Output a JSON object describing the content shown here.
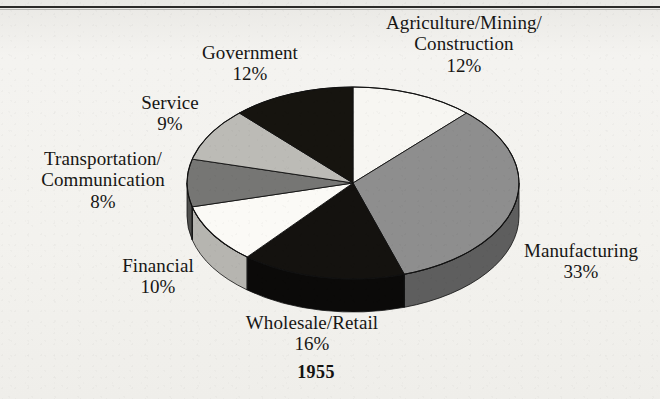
{
  "figure": {
    "year_label": "1955",
    "background_color": "#f2f1ee",
    "rule_color": "#2c2a28"
  },
  "chart_data": {
    "type": "pie",
    "title": "1955",
    "xlabel": "",
    "ylabel": "",
    "units": "percent",
    "total": 100,
    "start_angle_deg": 0,
    "direction": "clockwise",
    "three_d": true,
    "legend_position": "outside-labels",
    "grid": false,
    "categories": [
      "Agriculture/Mining/Construction",
      "Manufacturing",
      "Wholesale/Retail",
      "Financial",
      "Transportation/Communication",
      "Service",
      "Government"
    ],
    "values": [
      12,
      33,
      16,
      10,
      8,
      9,
      12
    ],
    "slices": [
      {
        "name": "Agriculture/Mining/Construction",
        "label_line1": "Agriculture/Mining/",
        "label_line2": "Construction",
        "value": 12,
        "percent_label": "12%",
        "color": "#f7f6f2",
        "side_color": "#ffffff"
      },
      {
        "name": "Manufacturing",
        "label_line1": "Manufacturing",
        "label_line2": "",
        "value": 33,
        "percent_label": "33%",
        "color": "#8e8e8e",
        "side_color": "#5e5e5e"
      },
      {
        "name": "Wholesale/Retail",
        "label_line1": "Wholesale/Retail",
        "label_line2": "",
        "value": 16,
        "percent_label": "16%",
        "color": "#14120f",
        "side_color": "#0b0a09"
      },
      {
        "name": "Financial",
        "label_line1": "Financial",
        "label_line2": "",
        "value": 10,
        "percent_label": "10%",
        "color": "#fbfaf6",
        "side_color": "#b6b5b0"
      },
      {
        "name": "Transportation/Communication",
        "label_line1": "Transportation/",
        "label_line2": "Communication",
        "value": 8,
        "percent_label": "8%",
        "color": "#767674",
        "side_color": "#4f4f4d"
      },
      {
        "name": "Service",
        "label_line1": "Service",
        "label_line2": "",
        "value": 9,
        "percent_label": "9%",
        "color": "#bcbbb6",
        "side_color": "#8a8984"
      },
      {
        "name": "Government",
        "label_line1": "Government",
        "label_line2": "",
        "value": 12,
        "percent_label": "12%",
        "color": "#16140f",
        "side_color": "#0b0a08"
      }
    ]
  },
  "labels": {
    "agriculture": {
      "line1": "Agriculture/Mining/",
      "line2": "Construction",
      "pct": "12%"
    },
    "government": {
      "line1": "Government",
      "line2": "",
      "pct": "12%"
    },
    "service": {
      "line1": "Service",
      "line2": "",
      "pct": "9%"
    },
    "transportation": {
      "line1": "Transportation/",
      "line2": "Communication",
      "pct": "8%"
    },
    "financial": {
      "line1": "Financial",
      "line2": "",
      "pct": "10%"
    },
    "wholesale": {
      "line1": "Wholesale/Retail",
      "line2": "",
      "pct": "16%"
    },
    "manufacturing": {
      "line1": "Manufacturing",
      "line2": "",
      "pct": "33%"
    }
  }
}
